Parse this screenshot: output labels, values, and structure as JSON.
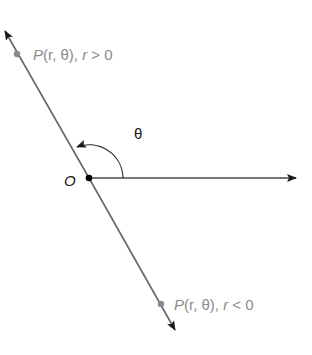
{
  "diagram": {
    "type": "polar-coordinates-negative-r",
    "origin_label": "O",
    "angle_label": "θ",
    "point_positive": {
      "label_P": "P",
      "label_args": "(r, θ), ",
      "label_r": "r",
      "label_cond": " > 0"
    },
    "point_negative": {
      "label_P": "P",
      "label_args": "(r, θ), ",
      "label_r": "r",
      "label_cond": " < 0"
    },
    "colors": {
      "line": "#666666",
      "polar_axis": "#4a4a4a",
      "arrow": "#1a1a1a",
      "points": "#8a8a8a",
      "labels": "#8a8a8a",
      "origin_dot": "#000000"
    }
  }
}
